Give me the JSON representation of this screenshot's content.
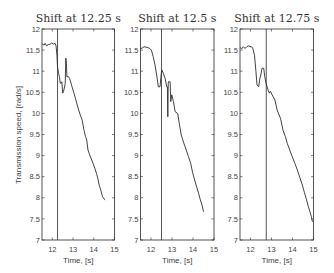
{
  "figure": {
    "ylabel": "Transmission speed, [rad/s]"
  },
  "chart_data": [
    {
      "type": "line",
      "title": "Shift at 12.25 s",
      "xlabel": "Time, [s]",
      "ylabel": "Transmission speed, [rad/s]",
      "xlim": [
        11.5,
        15
      ],
      "ylim": [
        7,
        12
      ],
      "xticks": [
        12,
        13,
        14,
        15
      ],
      "xtick_labels": [
        "12",
        "13",
        "14",
        "15"
      ],
      "yticks": [
        12,
        11.5,
        11,
        10.5,
        10,
        9.5,
        9,
        8.5,
        8,
        7.5,
        7
      ],
      "ytick_labels": [
        "12",
        "11.5",
        "11",
        "10.5",
        "10",
        "9.5",
        "9",
        "8.5",
        "8",
        "7.5",
        "7"
      ],
      "grid": false,
      "shift_time": 12.25,
      "series": [
        {
          "name": "transmission-speed",
          "points": [
            [
              11.5,
              11.65
            ],
            [
              11.6,
              11.62
            ],
            [
              11.65,
              11.66
            ],
            [
              11.72,
              11.6
            ],
            [
              11.8,
              11.63
            ],
            [
              11.89,
              11.64
            ],
            [
              11.97,
              11.67
            ],
            [
              12.05,
              11.64
            ],
            [
              12.13,
              11.66
            ],
            [
              12.18,
              11.6
            ],
            [
              12.22,
              11.38
            ],
            [
              12.25,
              11.1
            ],
            [
              12.3,
              10.95
            ],
            [
              12.34,
              10.87
            ],
            [
              12.38,
              10.72
            ],
            [
              12.41,
              10.71
            ],
            [
              12.46,
              10.75
            ],
            [
              12.5,
              10.48
            ],
            [
              12.54,
              10.52
            ],
            [
              12.6,
              10.65
            ],
            [
              12.62,
              10.71
            ],
            [
              12.65,
              11.31
            ],
            [
              12.68,
              11.19
            ],
            [
              12.7,
              10.87
            ],
            [
              12.78,
              10.87
            ],
            [
              12.83,
              10.83
            ],
            [
              12.9,
              10.72
            ],
            [
              12.95,
              10.63
            ],
            [
              13.03,
              10.5
            ],
            [
              13.11,
              10.36
            ],
            [
              13.19,
              10.22
            ],
            [
              13.27,
              10.08
            ],
            [
              13.35,
              9.96
            ],
            [
              13.44,
              9.84
            ],
            [
              13.52,
              9.62
            ],
            [
              13.6,
              9.45
            ],
            [
              13.66,
              9.37
            ],
            [
              13.72,
              9.13
            ],
            [
              13.8,
              9.02
            ],
            [
              13.88,
              8.92
            ],
            [
              13.96,
              8.82
            ],
            [
              14.05,
              8.7
            ],
            [
              14.13,
              8.58
            ],
            [
              14.2,
              8.45
            ],
            [
              14.26,
              8.3
            ],
            [
              14.34,
              8.18
            ],
            [
              14.42,
              8.03
            ],
            [
              14.5,
              7.97
            ],
            [
              14.55,
              7.95
            ]
          ]
        }
      ]
    },
    {
      "type": "line",
      "title": "Shift at 12.5 s",
      "xlabel": "Time, [s]",
      "ylabel": "",
      "xlim": [
        11.5,
        15
      ],
      "ylim": [
        7,
        12
      ],
      "xticks": [
        12,
        13,
        14,
        15
      ],
      "xtick_labels": [
        "12",
        "13",
        "14",
        "15"
      ],
      "yticks": [
        12,
        11.5,
        11,
        10.5,
        10,
        9.5,
        9,
        8.5,
        8,
        7.5,
        7
      ],
      "ytick_labels": [
        "12",
        "11.5",
        "11",
        "10.5",
        "10",
        "9.5",
        "9",
        "8.5",
        "8",
        "7.5",
        "7"
      ],
      "grid": false,
      "shift_time": 12.5,
      "series": [
        {
          "name": "transmission-speed",
          "points": [
            [
              11.5,
              11.53
            ],
            [
              11.58,
              11.55
            ],
            [
              11.67,
              11.58
            ],
            [
              11.76,
              11.57
            ],
            [
              11.85,
              11.56
            ],
            [
              11.94,
              11.54
            ],
            [
              12.02,
              11.5
            ],
            [
              12.1,
              11.35
            ],
            [
              12.19,
              11.15
            ],
            [
              12.27,
              10.91
            ],
            [
              12.35,
              10.63
            ],
            [
              12.43,
              10.63
            ],
            [
              12.47,
              10.85
            ],
            [
              12.51,
              11.03
            ],
            [
              12.59,
              10.95
            ],
            [
              12.67,
              10.83
            ],
            [
              12.75,
              10.63
            ],
            [
              12.78,
              10.63
            ],
            [
              12.8,
              9.92
            ],
            [
              12.82,
              10.7
            ],
            [
              12.83,
              10.75
            ],
            [
              12.91,
              10.75
            ],
            [
              12.94,
              10.28
            ],
            [
              12.99,
              10.44
            ],
            [
              13.07,
              10.28
            ],
            [
              13.15,
              10.04
            ],
            [
              13.27,
              10.0
            ],
            [
              13.35,
              9.75
            ],
            [
              13.44,
              9.49
            ],
            [
              13.56,
              9.3
            ],
            [
              13.68,
              9.13
            ],
            [
              13.78,
              8.98
            ],
            [
              13.89,
              8.82
            ],
            [
              13.98,
              8.6
            ],
            [
              14.08,
              8.42
            ],
            [
              14.18,
              8.25
            ],
            [
              14.27,
              8.1
            ],
            [
              14.35,
              7.95
            ],
            [
              14.43,
              7.83
            ],
            [
              14.5,
              7.67
            ]
          ]
        }
      ]
    },
    {
      "type": "line",
      "title": "Shift at 12.75 s",
      "xlabel": "Time, [s]",
      "ylabel": "",
      "xlim": [
        11.5,
        15
      ],
      "ylim": [
        7,
        12
      ],
      "xticks": [
        12,
        13,
        14,
        15
      ],
      "xtick_labels": [
        "12",
        "13",
        "14",
        "15"
      ],
      "yticks": [
        12,
        11.5,
        11,
        10.5,
        10,
        9.5,
        9,
        8.5,
        8,
        7.5,
        7
      ],
      "ytick_labels": [
        "12",
        "11.5",
        "11",
        "10.5",
        "10",
        "9.5",
        "9",
        "8.5",
        "8",
        "7.5",
        "7"
      ],
      "grid": false,
      "shift_time": 12.75,
      "series": [
        {
          "name": "transmission-speed",
          "points": [
            [
              11.5,
              11.56
            ],
            [
              11.58,
              11.53
            ],
            [
              11.66,
              11.58
            ],
            [
              11.74,
              11.54
            ],
            [
              11.82,
              11.58
            ],
            [
              11.9,
              11.6
            ],
            [
              12.03,
              11.58
            ],
            [
              12.1,
              11.56
            ],
            [
              12.19,
              11.38
            ],
            [
              12.26,
              10.99
            ],
            [
              12.31,
              10.67
            ],
            [
              12.39,
              10.63
            ],
            [
              12.43,
              10.79
            ],
            [
              12.49,
              10.91
            ],
            [
              12.55,
              11.07
            ],
            [
              12.63,
              11.07
            ],
            [
              12.68,
              10.87
            ],
            [
              12.74,
              10.71
            ],
            [
              12.84,
              10.55
            ],
            [
              12.9,
              10.48
            ],
            [
              12.95,
              10.52
            ],
            [
              13.03,
              10.44
            ],
            [
              13.16,
              10.32
            ],
            [
              13.27,
              10.08
            ],
            [
              13.43,
              9.88
            ],
            [
              13.55,
              9.6
            ],
            [
              13.66,
              9.45
            ],
            [
              13.75,
              9.29
            ],
            [
              13.87,
              9.13
            ],
            [
              13.99,
              8.97
            ],
            [
              14.11,
              8.82
            ],
            [
              14.23,
              8.66
            ],
            [
              14.35,
              8.48
            ],
            [
              14.47,
              8.3
            ],
            [
              14.57,
              8.12
            ],
            [
              14.67,
              7.95
            ],
            [
              14.75,
              7.8
            ],
            [
              14.83,
              7.67
            ],
            [
              14.9,
              7.55
            ],
            [
              14.95,
              7.43
            ]
          ]
        }
      ]
    }
  ]
}
